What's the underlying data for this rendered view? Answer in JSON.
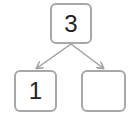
{
  "diagram": {
    "type": "number-bond",
    "whole": "3",
    "parts": [
      "1",
      ""
    ],
    "colors": {
      "border": "#a8a8a8",
      "arrow": "#a0a0a0",
      "text": "#222222"
    }
  }
}
